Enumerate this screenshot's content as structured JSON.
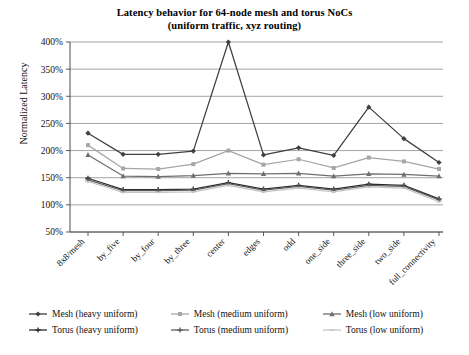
{
  "chart_data": {
    "type": "line",
    "title": "Latency behavior for 64-node mesh and torus NoCs (uniform traffic, xyz routing)",
    "title_line1": "Latency behavior for 64-node mesh and torus NoCs",
    "title_line2": "(uniform traffic, xyz routing)",
    "xlabel": "",
    "ylabel": "Normalized Latency",
    "ylim": [
      50,
      400
    ],
    "ytick_values": [
      50,
      100,
      150,
      200,
      250,
      300,
      350,
      400
    ],
    "ytick_labels": [
      "50%",
      "100%",
      "150%",
      "200%",
      "250%",
      "300%",
      "350%",
      "400%"
    ],
    "grid": true,
    "legend_position": "bottom",
    "categories": [
      "8x8/mesh",
      "by_five",
      "by_four",
      "by_three",
      "center",
      "edges",
      "odd",
      "one_side",
      "three_side",
      "two_side",
      "full_connectivity"
    ],
    "series": [
      {
        "name": "Mesh (heavy uniform)",
        "color": "#3f3f3f",
        "marker": "diamond",
        "values": [
          232,
          193,
          193,
          199,
          400,
          192,
          205,
          191,
          280,
          222,
          178
        ]
      },
      {
        "name": "Mesh (medium uniform)",
        "color": "#a6a6a6",
        "marker": "square",
        "values": [
          210,
          167,
          166,
          175,
          200,
          174,
          184,
          168,
          187,
          180,
          166
        ]
      },
      {
        "name": "Mesh (low uniform)",
        "color": "#6e6e6e",
        "marker": "triangle",
        "values": [
          192,
          153,
          152,
          154,
          158,
          157,
          158,
          153,
          157,
          156,
          153
        ]
      },
      {
        "name": "Torus (heavy uniform)",
        "color": "#2b2b2b",
        "marker": "cross",
        "values": [
          149,
          128,
          128,
          129,
          141,
          129,
          136,
          129,
          138,
          136,
          111
        ]
      },
      {
        "name": "Torus (medium uniform)",
        "color": "#5c5c5c",
        "marker": "cross",
        "values": [
          146,
          126,
          126,
          127,
          139,
          127,
          134,
          127,
          136,
          134,
          109
        ]
      },
      {
        "name": "Torus (low uniform)",
        "color": "#c4c4c4",
        "marker": "dash",
        "values": [
          143,
          123,
          123,
          124,
          136,
          124,
          131,
          124,
          133,
          131,
          106
        ]
      }
    ]
  },
  "legend": {
    "rows": [
      [
        {
          "label": "Mesh (heavy uniform)",
          "series": 0
        },
        {
          "label": "Mesh (medium uniform)",
          "series": 1
        },
        {
          "label": "Mesh (low uniform)",
          "series": 2
        }
      ],
      [
        {
          "label": "Torus (heavy uniform)",
          "series": 3
        },
        {
          "label": "Torus (medium uniform)",
          "series": 4
        },
        {
          "label": "Torus (low uniform)",
          "series": 5
        }
      ]
    ]
  }
}
